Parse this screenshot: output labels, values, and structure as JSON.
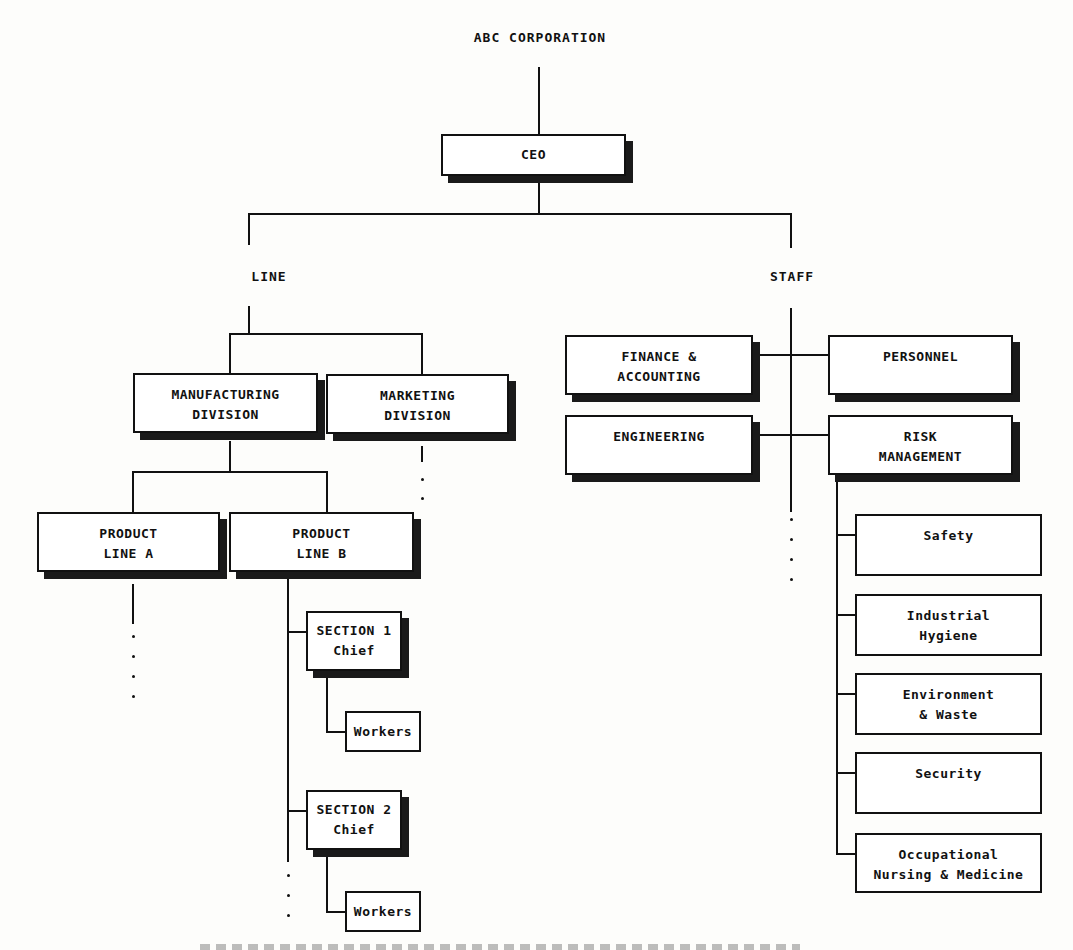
{
  "title": "ABC CORPORATION",
  "ceo": "CEO",
  "line": {
    "label": "LINE",
    "manufacturing": [
      "MANUFACTURING",
      "DIVISION"
    ],
    "marketing": [
      "MARKETING",
      "DIVISION"
    ],
    "product_a": [
      "PRODUCT",
      "LINE A"
    ],
    "product_b": [
      "PRODUCT",
      "LINE B"
    ],
    "section1": [
      "SECTION 1",
      "Chief"
    ],
    "section2": [
      "SECTION 2",
      "Chief"
    ],
    "workers1": "Workers",
    "workers2": "Workers"
  },
  "staff": {
    "label": "STAFF",
    "finance": [
      "FINANCE &",
      "ACCOUNTING"
    ],
    "personnel": "PERSONNEL",
    "engineering": "ENGINEERING",
    "risk": [
      "RISK",
      "MANAGEMENT"
    ],
    "risk_units": [
      [
        "Safety"
      ],
      [
        "Industrial",
        "Hygiene"
      ],
      [
        "Environment",
        "& Waste"
      ],
      [
        "Security"
      ],
      [
        "Occupational",
        "Nursing & Medicine"
      ]
    ]
  }
}
